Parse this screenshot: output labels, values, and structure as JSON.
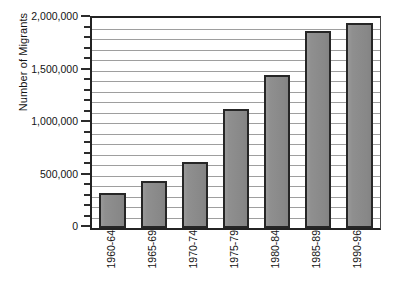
{
  "chart_data": {
    "type": "bar",
    "title": "",
    "xlabel": "",
    "ylabel": "Number of Migrants",
    "categories": [
      "1960-64",
      "1965-69",
      "1970-74",
      "1975-79",
      "1980-84",
      "1985-89",
      "1990-96"
    ],
    "values": [
      330000,
      450000,
      630000,
      1130000,
      1460000,
      1880000,
      1950000
    ],
    "ylim": [
      0,
      2000000
    ],
    "ytick_values": [
      0,
      500000,
      1000000,
      1500000,
      2000000
    ],
    "ytick_labels": [
      "0",
      "500,000",
      "1,000,000",
      "1,500,000",
      "2,000,000"
    ],
    "minor_tick_interval": 100000,
    "gridline_interval": 100000,
    "grid": true,
    "grid_axis": "y",
    "legend": false,
    "legend_position": "none",
    "orientation": "vertical",
    "xtick_label_rotation": 90,
    "colors": {
      "bar_fill": "#8d8d8d",
      "bar_border": "#262626",
      "gridline": "#9e9e9e",
      "axis": "#232323",
      "text": "#141414",
      "background": "#ffffff"
    }
  }
}
